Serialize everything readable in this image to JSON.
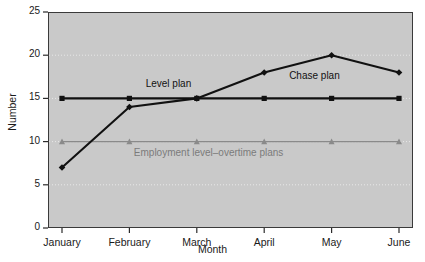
{
  "chart_data": {
    "type": "line",
    "title": "",
    "xlabel": "Month",
    "ylabel": "Number",
    "categories": [
      "January",
      "February",
      "March",
      "April",
      "May",
      "June"
    ],
    "ylim": [
      0,
      25
    ],
    "yticks": [
      0,
      5,
      10,
      15,
      20,
      25
    ],
    "grid": true,
    "grid_style": "dotted-horizontal",
    "legend": "inline-annotations",
    "plot_background": "#c9c9c9",
    "page_background": "#ffffff",
    "series": [
      {
        "name": "Level plan",
        "values": [
          15,
          15,
          15,
          15,
          15,
          15
        ],
        "color": "#111111",
        "marker": "square",
        "label_x_pct": 33,
        "label_y_value": 16.6
      },
      {
        "name": "Chase plan",
        "values": [
          7,
          14,
          15,
          18,
          20,
          18
        ],
        "color": "#111111",
        "marker": "diamond",
        "label_x_pct": 73,
        "label_y_value": 17.5
      },
      {
        "name": "Employment level–overtime plans",
        "values": [
          10,
          10,
          10,
          10,
          10,
          10
        ],
        "color": "#8a8a8a",
        "marker": "triangle",
        "label_x_pct": 44,
        "label_y_value": 8.6
      }
    ]
  },
  "axes": {
    "y_tick_labels": [
      "0",
      "5",
      "10",
      "15",
      "20",
      "25"
    ],
    "x_tick_labels": [
      "January",
      "February",
      "March",
      "April",
      "May",
      "June"
    ],
    "y_title": "Number",
    "x_title": "Month"
  },
  "annotations": [
    {
      "text": "Level plan",
      "color": "#111111"
    },
    {
      "text": "Chase plan",
      "color": "#111111"
    },
    {
      "text": "Employment level–overtime plans",
      "color": "#7b7b7b"
    }
  ]
}
